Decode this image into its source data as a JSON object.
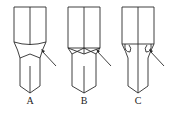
{
  "figure": {
    "panels": [
      {
        "label": "A",
        "description": "tool with curved shoulder transition, arrow pointing to transition zone"
      },
      {
        "label": "B",
        "description": "tool with crossed chamfer transition, arrow pointing to transition zone"
      },
      {
        "label": "C",
        "description": "tool with rounded undercut notches, arrow pointing to notch"
      }
    ],
    "colors": {
      "line": "#2a2a2a",
      "background": "#ffffff"
    }
  }
}
